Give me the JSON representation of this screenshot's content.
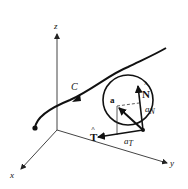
{
  "diagram": {
    "axes": {
      "x_label": "x",
      "y_label": "y",
      "z_label": "z"
    },
    "curve": {
      "label": "C"
    },
    "vectors": {
      "unit_normal_label": "N",
      "unit_normal_hat": "^",
      "unit_tangent_label": "T",
      "unit_tangent_hat": "^",
      "acceleration_label": "a",
      "normal_component_main": "a",
      "normal_component_sub": "N",
      "tangential_component_main": "a",
      "tangential_component_sub": "T"
    },
    "colors": {
      "ink": "#111111",
      "axis": "#444444",
      "background": "#ffffff"
    }
  }
}
